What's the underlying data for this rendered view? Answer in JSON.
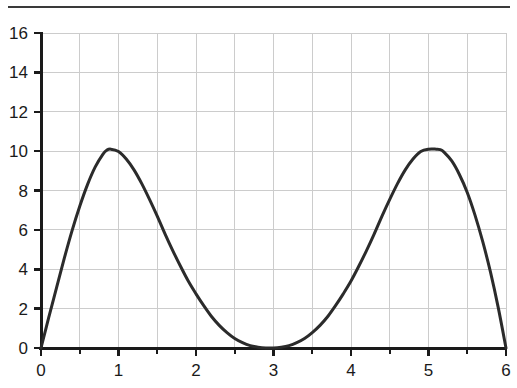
{
  "figure": {
    "background_color": "#ffffff",
    "rule_color": "#3a3a3a",
    "has_top_rule": true
  },
  "chart_data": {
    "type": "line",
    "title": "",
    "subtitle": "",
    "xlabel": "",
    "ylabel": "",
    "xlim": [
      0,
      6
    ],
    "ylim": [
      0,
      16
    ],
    "xticks": [
      0,
      1,
      2,
      3,
      4,
      5,
      6
    ],
    "xtick_labels": [
      "0",
      "1",
      "2",
      "3",
      "4",
      "5",
      "6"
    ],
    "yticks": [
      0,
      2,
      4,
      6,
      8,
      10,
      12,
      14,
      16
    ],
    "ytick_labels": [
      "0",
      "2",
      "4",
      "6",
      "8",
      "10",
      "12",
      "14",
      "16"
    ],
    "x_minor_ticks": [
      0.5,
      1.5,
      2.5,
      3.5,
      4.5,
      5.5
    ],
    "grid": true,
    "grid_color": "#cccccc",
    "grid_x_values": [
      0.5,
      1,
      1.5,
      2,
      2.5,
      3,
      3.5,
      4,
      4.5,
      5,
      5.5,
      6
    ],
    "grid_y_values": [
      2,
      4,
      6,
      8,
      10,
      12,
      14,
      16
    ],
    "legend": null,
    "legend_position": "none",
    "axis_color": "#1a1a1a",
    "series": [
      {
        "name": "curve",
        "color": "#2b2b2b",
        "line_width": 3,
        "x": [
          0,
          0.1,
          0.2,
          0.3,
          0.4,
          0.5,
          0.6,
          0.7,
          0.8,
          0.85,
          0.9,
          1.0,
          1.1,
          1.2,
          1.3,
          1.4,
          1.5,
          1.6,
          1.7,
          1.8,
          1.9,
          2.0,
          2.1,
          2.2,
          2.3,
          2.4,
          2.5,
          2.6,
          2.7,
          2.8,
          2.9,
          3.0,
          3.1,
          3.2,
          3.3,
          3.4,
          3.5,
          3.6,
          3.7,
          3.8,
          3.9,
          4.0,
          4.1,
          4.2,
          4.3,
          4.4,
          4.5,
          4.6,
          4.7,
          4.8,
          4.9,
          5.0,
          5.1,
          5.15,
          5.2,
          5.3,
          5.4,
          5.5,
          5.6,
          5.7,
          5.8,
          5.9,
          6.0
        ],
        "y": [
          0,
          1.55,
          3.05,
          4.55,
          5.95,
          7.2,
          8.3,
          9.2,
          9.85,
          10.05,
          10.1,
          9.98,
          9.6,
          9.05,
          8.35,
          7.55,
          6.7,
          5.8,
          4.95,
          4.15,
          3.4,
          2.75,
          2.15,
          1.6,
          1.15,
          0.78,
          0.48,
          0.27,
          0.12,
          0.04,
          0.0,
          0.0,
          0.04,
          0.12,
          0.27,
          0.48,
          0.78,
          1.15,
          1.6,
          2.15,
          2.75,
          3.4,
          4.15,
          4.95,
          5.8,
          6.7,
          7.55,
          8.35,
          9.05,
          9.6,
          9.98,
          10.1,
          10.1,
          10.08,
          9.95,
          9.5,
          8.8,
          7.9,
          6.75,
          5.4,
          3.85,
          2.05,
          0.0
        ]
      }
    ],
    "annotations": {
      "zeros": [
        0,
        3,
        6
      ],
      "peaks": [
        {
          "x": 0.88,
          "y": 10.1
        },
        {
          "x": 5.12,
          "y": 10.1
        }
      ]
    }
  }
}
